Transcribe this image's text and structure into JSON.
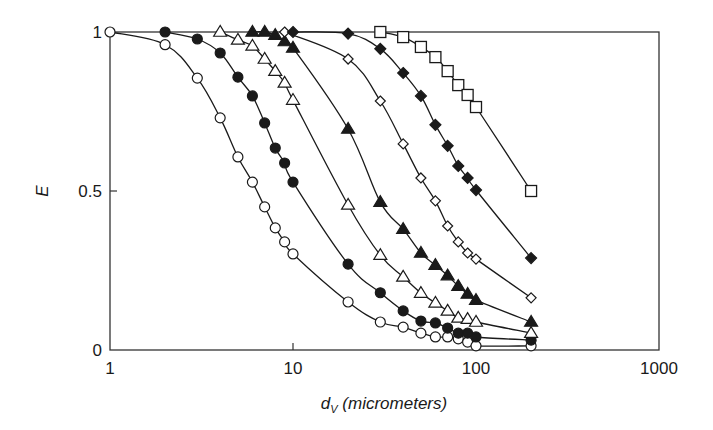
{
  "chart_data": {
    "type": "line",
    "title": "",
    "xlabel": "d_V (micrometers)",
    "xlabel_main": "d",
    "xlabel_sub": "V",
    "xlabel_rest": " (micrometers)",
    "ylabel": "E",
    "xscale": "log",
    "xlim": [
      1,
      1000
    ],
    "ylim": [
      0,
      1
    ],
    "grid": false,
    "legend": "none",
    "x_ticks": [
      {
        "value": 1,
        "label": "1"
      },
      {
        "value": 10,
        "label": "10"
      },
      {
        "value": 100,
        "label": "100"
      },
      {
        "value": 1000,
        "label": "1000"
      }
    ],
    "y_ticks": [
      {
        "value": 0,
        "label": "0"
      },
      {
        "value": 0.5,
        "label": "0.5"
      },
      {
        "value": 1,
        "label": "1"
      }
    ],
    "series": [
      {
        "name": "open-circle",
        "marker": "circle",
        "filled": false,
        "x": [
          1,
          2,
          3,
          4,
          5,
          6,
          7,
          8,
          9,
          10,
          20,
          30,
          40,
          50,
          60,
          70,
          80,
          90,
          100,
          200
        ],
        "y": [
          1.0,
          0.96,
          0.855,
          0.73,
          0.607,
          0.528,
          0.45,
          0.384,
          0.34,
          0.302,
          0.151,
          0.088,
          0.072,
          0.053,
          0.041,
          0.041,
          0.035,
          0.025,
          0.013,
          0.013
        ]
      },
      {
        "name": "filled-circle",
        "marker": "circle",
        "filled": true,
        "x": [
          2,
          3,
          4,
          5,
          6,
          7,
          8,
          9,
          10,
          20,
          30,
          40,
          50,
          60,
          70,
          80,
          90,
          100,
          200
        ],
        "y": [
          1.0,
          0.978,
          0.934,
          0.858,
          0.799,
          0.714,
          0.635,
          0.588,
          0.528,
          0.27,
          0.18,
          0.123,
          0.091,
          0.085,
          0.069,
          0.053,
          0.053,
          0.041,
          0.031
        ]
      },
      {
        "name": "open-triangle",
        "marker": "triangle",
        "filled": false,
        "x": [
          4,
          5,
          6,
          7,
          8,
          9,
          10,
          20,
          30,
          40,
          50,
          60,
          70,
          80,
          90,
          100,
          200
        ],
        "y": [
          1.0,
          0.975,
          0.956,
          0.915,
          0.877,
          0.84,
          0.786,
          0.456,
          0.298,
          0.23,
          0.179,
          0.148,
          0.123,
          0.101,
          0.097,
          0.088,
          0.053
        ]
      },
      {
        "name": "filled-triangle",
        "marker": "triangle",
        "filled": true,
        "x": [
          6,
          7,
          8,
          9,
          10,
          20,
          30,
          40,
          50,
          60,
          70,
          80,
          90,
          100,
          200
        ],
        "y": [
          1.0,
          1.0,
          0.99,
          0.97,
          0.95,
          0.695,
          0.465,
          0.38,
          0.305,
          0.267,
          0.234,
          0.201,
          0.176,
          0.157,
          0.088
        ]
      },
      {
        "name": "open-diamond",
        "marker": "diamond",
        "filled": false,
        "x": [
          9,
          20,
          30,
          40,
          50,
          60,
          70,
          80,
          90,
          100,
          200
        ],
        "y": [
          1.0,
          0.915,
          0.783,
          0.648,
          0.541,
          0.469,
          0.39,
          0.34,
          0.305,
          0.286,
          0.164
        ]
      },
      {
        "name": "filled-diamond",
        "marker": "diamond",
        "filled": true,
        "x": [
          10,
          20,
          30,
          40,
          50,
          60,
          70,
          80,
          90,
          100,
          200
        ],
        "y": [
          1.0,
          0.995,
          0.947,
          0.871,
          0.799,
          0.708,
          0.642,
          0.579,
          0.541,
          0.503,
          0.289
        ]
      },
      {
        "name": "open-square",
        "marker": "square",
        "filled": false,
        "x": [
          30,
          40,
          50,
          60,
          70,
          80,
          90,
          100,
          200
        ],
        "y": [
          1.0,
          0.984,
          0.953,
          0.921,
          0.877,
          0.833,
          0.802,
          0.764,
          0.5
        ]
      }
    ]
  },
  "colors": {
    "ink": "#1a1a1a",
    "background": "#ffffff",
    "frame": "#333333"
  }
}
